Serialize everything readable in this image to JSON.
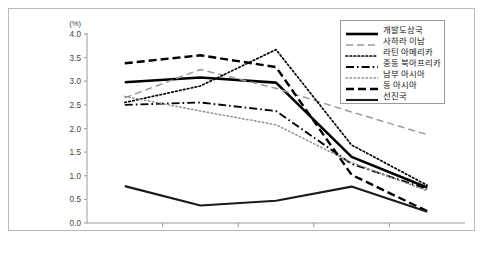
{
  "figure": {
    "unit_label": "(%)",
    "caption_partial": ""
  },
  "legend": {
    "position": "top-right",
    "entries": [
      {
        "label": "개발도상국",
        "style": "thick-solid-black",
        "color": "#000000"
      },
      {
        "label": "사하라 이남",
        "style": "dashed-gray",
        "color": "#9a9a9a"
      },
      {
        "label": "라틴 아메리카",
        "style": "dotted-black",
        "color": "#000000"
      },
      {
        "label": "중동 북아프리카",
        "style": "dash-dot-black",
        "color": "#000000"
      },
      {
        "label": "남부 아시아",
        "style": "fine-dotted-gray",
        "color": "#8d8d8d"
      },
      {
        "label": "동 아시아",
        "style": "thick-dashed-black",
        "color": "#000000"
      },
      {
        "label": "선진국",
        "style": "medium-solid-black",
        "color": "#1a1a1a"
      }
    ]
  },
  "chart_data": {
    "type": "line",
    "title": "",
    "xlabel": "",
    "ylabel": "(%)",
    "ylim": [
      0.0,
      4.0
    ],
    "ytick_step": 0.5,
    "grid": false,
    "legend_position": "top-right",
    "categories": [
      "1961-2007",
      "1987-2007",
      "1997-2007",
      "2007-2030",
      "2030-2050"
    ],
    "ytick_labels": [
      "0.0",
      "0.5",
      "1.0",
      "1.5",
      "2.0",
      "2.5",
      "3.0",
      "3.5",
      "4.0"
    ],
    "series": [
      {
        "name": "개발도상국",
        "values": [
          2.98,
          3.08,
          2.97,
          1.4,
          0.75
        ]
      },
      {
        "name": "사하라 이남",
        "values": [
          2.65,
          3.25,
          2.85,
          2.35,
          1.87
        ]
      },
      {
        "name": "라틴 아메리카",
        "values": [
          2.55,
          2.9,
          3.67,
          1.65,
          0.8
        ]
      },
      {
        "name": "중동 북아프리카",
        "values": [
          2.5,
          2.55,
          2.37,
          1.25,
          0.72
        ]
      },
      {
        "name": "남부 아시아",
        "values": [
          2.68,
          2.37,
          2.08,
          1.28,
          0.68
        ]
      },
      {
        "name": "동 아시아",
        "values": [
          3.38,
          3.55,
          3.3,
          1.02,
          0.25
        ]
      },
      {
        "name": "선진국",
        "values": [
          0.78,
          0.37,
          0.47,
          0.77,
          0.24
        ]
      }
    ]
  }
}
